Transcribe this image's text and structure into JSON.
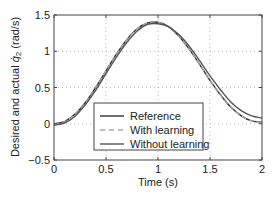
{
  "chart_data": {
    "type": "line",
    "title": "",
    "xlabel": "Time (s)",
    "ylabel": "Desired and actual q̇2 (rad/s)",
    "ylabel_parts": {
      "prefix": "Desired and actual ",
      "symbol": "q̇",
      "sub": "2",
      "suffix": " (rad/s)"
    },
    "xlim": [
      0,
      2
    ],
    "ylim": [
      -0.5,
      1.5
    ],
    "xticks": [
      "0",
      "0.5",
      "1",
      "1.5",
      "2"
    ],
    "yticks": [
      "-0.5",
      "0",
      "0.5",
      "1",
      "1.5"
    ],
    "grid": true,
    "legend_position": "lower center",
    "legend": [
      "Reference",
      "With learning",
      "Without learning"
    ],
    "x": [
      0,
      0.1,
      0.2,
      0.3,
      0.4,
      0.5,
      0.6,
      0.7,
      0.8,
      0.9,
      1.0,
      1.1,
      1.2,
      1.3,
      1.4,
      1.5,
      1.6,
      1.7,
      1.8,
      1.9,
      2.0
    ],
    "series": [
      {
        "name": "Reference",
        "style": "solid",
        "color": "#333333",
        "values": [
          0.0,
          0.03,
          0.13,
          0.29,
          0.5,
          0.73,
          0.96,
          1.16,
          1.31,
          1.39,
          1.4,
          1.34,
          1.21,
          1.03,
          0.82,
          0.6,
          0.4,
          0.23,
          0.11,
          0.04,
          0.02
        ]
      },
      {
        "name": "With learning",
        "style": "dashed",
        "color": "#aaaaaa",
        "values": [
          0.0,
          0.03,
          0.13,
          0.29,
          0.5,
          0.73,
          0.96,
          1.16,
          1.31,
          1.39,
          1.4,
          1.34,
          1.21,
          1.03,
          0.82,
          0.6,
          0.4,
          0.23,
          0.11,
          0.04,
          0.02
        ]
      },
      {
        "name": "Without learning",
        "style": "solid",
        "color": "#555555",
        "values": [
          -0.02,
          0.01,
          0.1,
          0.26,
          0.46,
          0.69,
          0.92,
          1.12,
          1.28,
          1.37,
          1.38,
          1.34,
          1.23,
          1.07,
          0.87,
          0.66,
          0.47,
          0.3,
          0.18,
          0.11,
          0.08
        ]
      }
    ]
  }
}
